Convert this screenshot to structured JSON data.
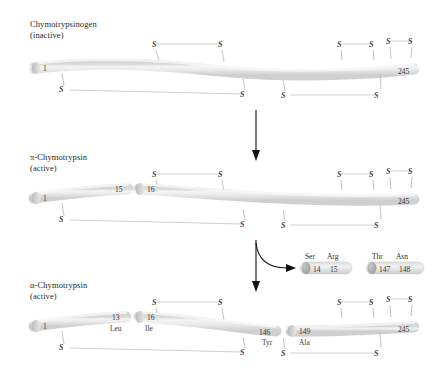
{
  "figure": {
    "background_color": "#ffffff",
    "chain_color": "#e3e3e3",
    "chain_edge_color": "#cfcfcf",
    "bond_color": "#c9c9c9",
    "arrow_color": "#111111",
    "sulfur_glyph": "S"
  },
  "stages": [
    {
      "id": "chymotrypsinogen",
      "label_line1": "Chymotrypsinogen",
      "label_line2": "(inactive)",
      "residue_labels": [
        {
          "number": "1",
          "name": ""
        },
        {
          "number": "245",
          "name": ""
        }
      ],
      "sulfurs_above": [
        "S",
        "S",
        "S",
        "S",
        "S",
        "S"
      ],
      "sulfurs_below": [
        "S",
        "S",
        "S",
        "S",
        "S"
      ]
    },
    {
      "id": "pi-chymotrypsin",
      "label_line1": "π-Chymotrypsin",
      "label_line2": "(active)",
      "residue_labels": [
        {
          "number": "1",
          "name": ""
        },
        {
          "number": "15",
          "name": ""
        },
        {
          "number": "16",
          "name": ""
        },
        {
          "number": "245",
          "name": ""
        }
      ],
      "sulfurs_above": [
        "S",
        "S",
        "S",
        "S",
        "S",
        "S"
      ],
      "sulfurs_below": [
        "S",
        "S",
        "S",
        "S",
        "S"
      ]
    },
    {
      "id": "alpha-chymotrypsin",
      "label_line1": "α-Chymotrypsin",
      "label_line2": "(active)",
      "residue_labels": [
        {
          "number": "1",
          "name": ""
        },
        {
          "number": "13",
          "name": "Leu"
        },
        {
          "number": "16",
          "name": "Ile"
        },
        {
          "number": "146",
          "name": "Tyr"
        },
        {
          "number": "149",
          "name": "Ala"
        },
        {
          "number": "245",
          "name": ""
        }
      ],
      "sulfurs_above": [
        "S",
        "S",
        "S",
        "S",
        "S",
        "S"
      ],
      "sulfurs_below": [
        "S",
        "S",
        "S",
        "S",
        "S"
      ]
    }
  ],
  "released_peptides": [
    {
      "id": "peptide-ser-arg",
      "residue_names": [
        "Ser",
        "Arg"
      ],
      "residue_numbers": [
        "14",
        "15"
      ]
    },
    {
      "id": "peptide-thr-asn",
      "residue_names": [
        "Thr",
        "Asn"
      ],
      "residue_numbers": [
        "147",
        "148"
      ]
    }
  ]
}
